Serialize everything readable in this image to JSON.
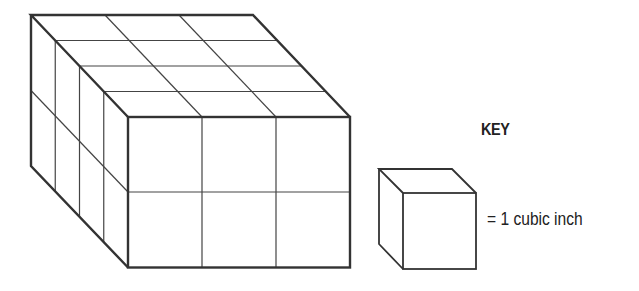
{
  "diagram": {
    "type": "volume-unit-cubes",
    "prism": {
      "length_cubes": 3,
      "height_cubes": 2,
      "depth_cubes": 4,
      "colors": {
        "stroke": "#333333",
        "fill": "#ffffff"
      }
    },
    "key": {
      "title": "KEY",
      "label": "= 1 cubic inch"
    }
  }
}
